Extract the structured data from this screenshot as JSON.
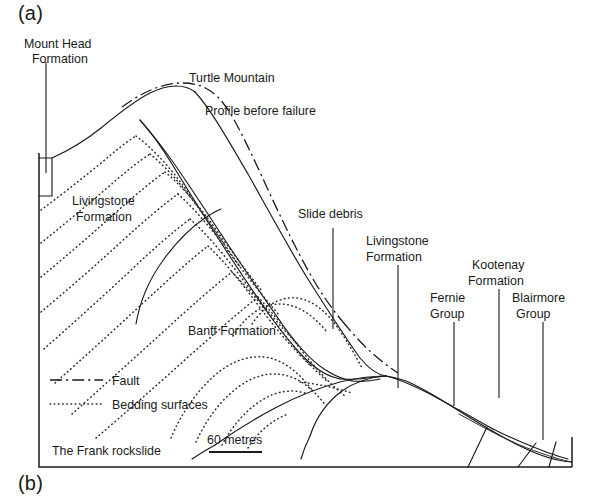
{
  "figure": {
    "panel_a_label": "(a)",
    "panel_b_label": "(b)",
    "caption": "The Frank rockslide"
  },
  "labels": {
    "mount_head_line1": "Mount Head",
    "mount_head_line2": "Formation",
    "turtle_mountain": "Turtle Mountain",
    "profile_before_failure": "Profile before failure",
    "livingstone_left_line1": "Livingstone",
    "livingstone_left_line2": "Formation",
    "banff_formation": "Banff Formation",
    "slide_debris": "Slide debris",
    "livingstone_right_line1": "Livingstone",
    "livingstone_right_line2": "Formation",
    "fernie_line1": "Fernie",
    "fernie_line2": "Group",
    "kootenay_line1": "Kootenay",
    "kootenay_line2": "Formation",
    "blairmore_line1": "Blairmore",
    "blairmore_line2": "Group"
  },
  "legend": {
    "fault_label": "Fault",
    "bedding_label": "Bedding surfaces"
  },
  "scale": {
    "value_label": "60 metres"
  },
  "colors": {
    "ink": "#1a1a1a",
    "line": "#2b2b2b",
    "background": "#ffffff"
  }
}
